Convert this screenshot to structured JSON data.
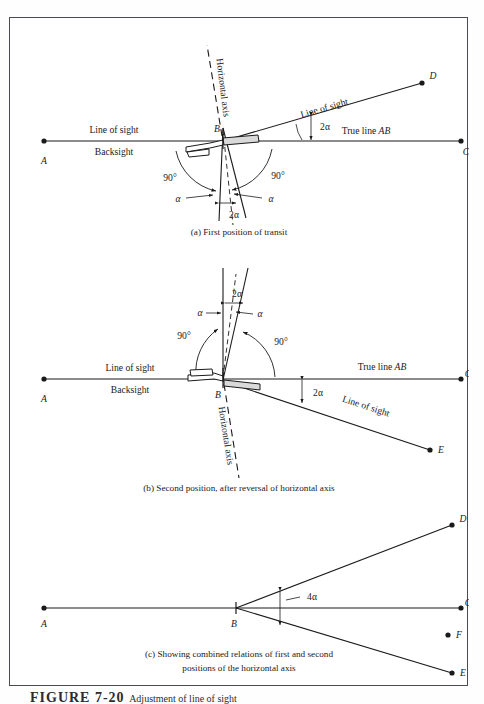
{
  "figure": {
    "number": "FIGURE 7-20",
    "title": "Adjustment of line of sight"
  },
  "panels": [
    {
      "id": "a",
      "caption": "(a) First position of transit",
      "points": [
        {
          "name": "A",
          "label": "A"
        },
        {
          "name": "B",
          "label": "B"
        },
        {
          "name": "C",
          "label": "C"
        },
        {
          "name": "D",
          "label": "D"
        }
      ],
      "labels": {
        "line_of_sight_left": "Line of sight",
        "backsight": "Backsight",
        "true_line": "True line AB",
        "true_line_plain": "True line ",
        "true_line_italic": "AB",
        "line_of_sight_right": "Line of sight",
        "horizontal_axis": "Horizontal axis",
        "angle_right_1": "90°",
        "angle_right_2": "90°",
        "alpha_left": "α",
        "alpha_right": "α",
        "two_alpha_lower": "2α",
        "two_alpha_upper": "2α"
      }
    },
    {
      "id": "b",
      "caption": "(b) Second position, after reversal of horizontal axis",
      "points": [
        {
          "name": "A",
          "label": "A"
        },
        {
          "name": "B",
          "label": "B"
        },
        {
          "name": "C",
          "label": "C"
        },
        {
          "name": "E",
          "label": "E"
        }
      ],
      "labels": {
        "line_of_sight_left": "Line of sight",
        "backsight": "Backsight",
        "true_line_plain": "True line ",
        "true_line_italic": "AB",
        "line_of_sight_right": "Line of sight",
        "horizontal_axis": "Horizontal axis",
        "angle_right_1": "90°",
        "angle_right_2": "90°",
        "alpha_left": "α",
        "alpha_right": "α",
        "two_alpha_upper": "2α",
        "two_alpha_right": "2α"
      }
    },
    {
      "id": "c",
      "caption_line1": "(c) Showing combined relations of first and second",
      "caption_line2": "positions of the horizontal axis",
      "points": [
        {
          "name": "A",
          "label": "A"
        },
        {
          "name": "B",
          "label": "B"
        },
        {
          "name": "C",
          "label": "C"
        },
        {
          "name": "D",
          "label": "D"
        },
        {
          "name": "E",
          "label": "E"
        },
        {
          "name": "F",
          "label": "F"
        }
      ],
      "labels": {
        "four_alpha": "4α"
      }
    }
  ],
  "colors": {
    "ink": "#1a1a1a",
    "frame": "#4a4a50",
    "page": "#ffffff"
  }
}
